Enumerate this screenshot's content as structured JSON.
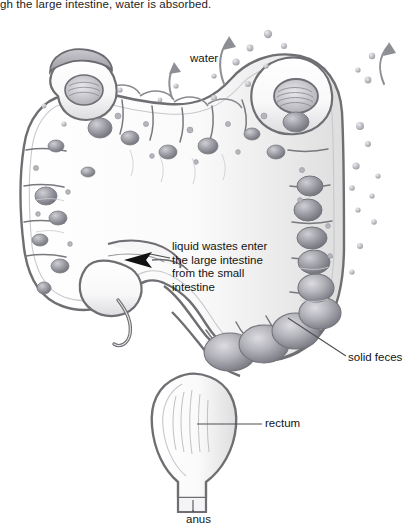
{
  "figure": {
    "caption": "gh the large intestine, water is absorbed.",
    "caption_note": "clipped top sentence",
    "type": "anatomical-illustration",
    "style": "grayscale pen-and-ink shaded drawing"
  },
  "labels": {
    "water": "water",
    "liquid_wastes": "liquid wastes enter\nthe large intestine\nfrom the small\nintestine",
    "solid_feces": "solid feces",
    "rectum": "rectum",
    "anus": "anus"
  },
  "colors": {
    "background": "#ffffff",
    "outline": "#6f6f73",
    "outline_dark": "#4d4d51",
    "organ_fill": "#fbfbfc",
    "organ_fill_shade": "#e6e6e9",
    "blob_light": "#d7d7dc",
    "blob_mid": "#a9a9b0",
    "blob_dark": "#7d7d85",
    "droplet": "#b9b9c0",
    "text": "#141414",
    "leader_line": "#5a5a5e",
    "arrow_fill": "#111111"
  },
  "structures": [
    {
      "name": "ascending colon",
      "region": "left vertical limb"
    },
    {
      "name": "hepatic flexure",
      "region": "upper left bend"
    },
    {
      "name": "transverse colon",
      "region": "upper horizontal span"
    },
    {
      "name": "splenic flexure",
      "region": "upper right bend"
    },
    {
      "name": "descending colon",
      "region": "right vertical limb"
    },
    {
      "name": "sigmoid colon",
      "region": "lower center S-curve"
    },
    {
      "name": "rectum",
      "region": "bottom center"
    },
    {
      "name": "anus",
      "region": "bottom center terminus"
    },
    {
      "name": "cecum",
      "region": "lower left pouch"
    },
    {
      "name": "appendix",
      "region": "lower left small projection"
    },
    {
      "name": "ileocecal junction",
      "region": "left middle, black arrow inlet"
    }
  ],
  "annotations": {
    "water_arrows": 3,
    "water_arrow_direction": "upward curved",
    "droplet_count": 26,
    "inlet_arrow": "black solid arrow pointing left into cecum",
    "leader_lines": [
      "solid feces diagonal",
      "rectum horizontal",
      "anus vertical"
    ]
  }
}
